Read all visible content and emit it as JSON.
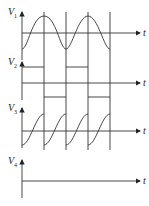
{
  "diagram": {
    "title": "",
    "panels": [
      {
        "label": "V",
        "subscript": "1",
        "axis_label": "t",
        "waveform": "sine"
      },
      {
        "label": "V",
        "subscript": "2",
        "axis_label": "t",
        "waveform": "square"
      },
      {
        "label": "V",
        "subscript": "3",
        "axis_label": "t",
        "waveform": "sawtooth-sine"
      },
      {
        "label": "V",
        "subscript": "4",
        "axis_label": "t",
        "waveform": "zero"
      }
    ],
    "caption": "(cut-off caption text, unreadable)"
  },
  "colors": {
    "line": "#333333",
    "background": "#ffffff"
  }
}
